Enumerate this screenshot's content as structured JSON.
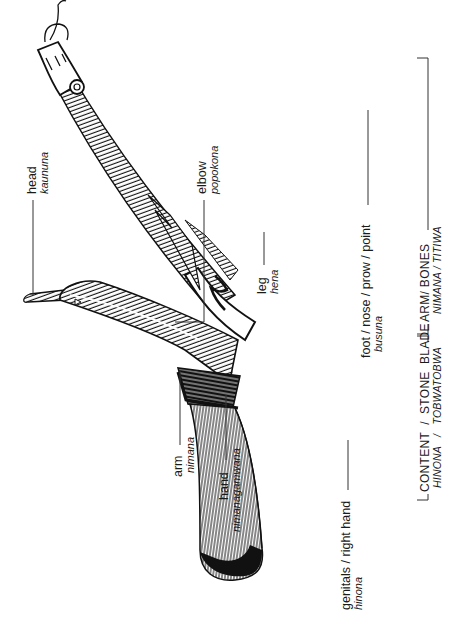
{
  "figure": {
    "orientation": "rotated 90 degrees counterclockwise"
  },
  "labels": {
    "head": {
      "en": "head",
      "native": "kaununa"
    },
    "elbow": {
      "en": "elbow",
      "native": "popokona"
    },
    "leg": {
      "en": "leg",
      "native": "hena"
    },
    "foot": {
      "en": "foot / nose / prow / point",
      "native": "busuna"
    },
    "arm": {
      "en": "arm",
      "native": "nimana"
    },
    "hand": {
      "en": "hand",
      "native": "nimanagamwana"
    },
    "genitals": {
      "en": "genitals / right hand",
      "native": "hinona"
    }
  },
  "brackets": {
    "content_blade": {
      "en": "CONTENT  /  STONE  BLADE",
      "native": "HINONA   /   TOBWATOBWA"
    },
    "arm_bones": {
      "en": "ARM/ BONES",
      "native": "NIMANA / TITIWA"
    }
  },
  "colors": {
    "ink": "#1a1a1a",
    "background": "#ffffff"
  }
}
